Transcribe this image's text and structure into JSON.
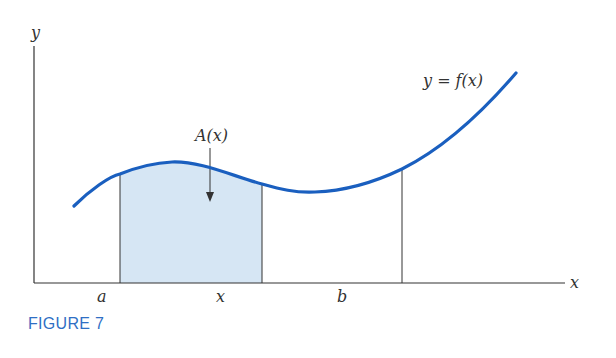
{
  "figure": {
    "caption": "FIGURE 7",
    "axes": {
      "x_label": "x",
      "y_label": "y"
    },
    "curve_label": "y = f(x)",
    "area_label": "A(x)",
    "tick_labels": {
      "a": "a",
      "x": "x",
      "b": "b"
    },
    "colors": {
      "curve": "#1a5fbf",
      "shade": "#d6e6f4",
      "caption": "#2f6fc4",
      "lines": "#333333"
    }
  }
}
